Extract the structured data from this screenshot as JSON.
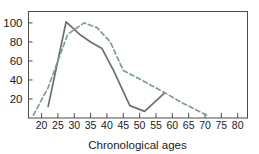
{
  "chart_data": {
    "type": "line",
    "title": "",
    "xlabel": "Chronological ages",
    "ylabel": "",
    "xlim": [
      16,
      83
    ],
    "ylim": [
      0,
      112
    ],
    "xticks": [
      20,
      25,
      30,
      35,
      40,
      45,
      50,
      55,
      60,
      65,
      70,
      75,
      80
    ],
    "yticks": [
      20,
      40,
      60,
      80,
      100
    ],
    "grid": false,
    "legend": "none",
    "series": [
      {
        "name": "solid-series",
        "style": "solid",
        "color": "#6e6e6e",
        "points": [
          [
            22.0,
            12
          ],
          [
            27.5,
            101
          ],
          [
            32.0,
            87
          ],
          [
            35.0,
            80
          ],
          [
            38.5,
            73
          ],
          [
            42.0,
            50
          ],
          [
            47.0,
            13
          ],
          [
            51.5,
            7
          ],
          [
            57.5,
            26
          ]
        ]
      },
      {
        "name": "dashed-series",
        "style": "dashed",
        "color": "#7e9e92",
        "points": [
          [
            17.5,
            3
          ],
          [
            22.0,
            32
          ],
          [
            28.0,
            88
          ],
          [
            33.0,
            100
          ],
          [
            37.0,
            95
          ],
          [
            41.0,
            80
          ],
          [
            45.0,
            50
          ],
          [
            50.0,
            41
          ],
          [
            57.5,
            27
          ],
          [
            63.0,
            16
          ],
          [
            70.5,
            3
          ]
        ]
      }
    ]
  },
  "axes": {
    "x_tick_labels": [
      "20",
      "25",
      "30",
      "35",
      "40",
      "45",
      "50",
      "55",
      "60",
      "65",
      "70",
      "75",
      "80"
    ],
    "y_tick_labels": [
      "20",
      "40",
      "60",
      "80",
      "100"
    ],
    "x_axis_title": "Chronological ages"
  },
  "colors": {
    "solid_line": "#6e6e6e",
    "dashed_line": "#7e9e92",
    "frame": "#4a4a4a",
    "text": "#1a1a1a",
    "background": "#ffffff"
  }
}
